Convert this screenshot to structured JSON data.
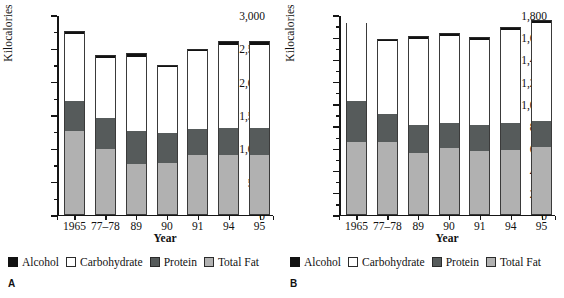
{
  "figure": {
    "legend_labels": {
      "alcohol": "Alcohol",
      "carbohydrate": "Carbohydrate",
      "protein": "Protein",
      "total_fat": "Total Fat"
    },
    "colors": {
      "alcohol": "#121212",
      "carbohydrate": "#ffffff",
      "protein": "#565b5b",
      "total_fat": "#b1b1b1"
    }
  },
  "panels": [
    {
      "letter": "A"
    },
    {
      "letter": "B"
    }
  ],
  "chart_data": [
    {
      "panel": "A",
      "type": "bar",
      "stacked": true,
      "title": "",
      "xlabel": "Year",
      "ylabel": "Kilocalories",
      "categories": [
        "1965",
        "77–78",
        "89",
        "90",
        "91",
        "94",
        "95"
      ],
      "ylim": [
        0,
        3000
      ],
      "yticks": [
        0,
        500,
        1000,
        1500,
        2000,
        2500,
        3000
      ],
      "ytick_labels": [
        "0",
        "500",
        "1,000",
        "1,500",
        "2,000",
        "2,500",
        "3,000"
      ],
      "yminor_step": 250,
      "grid": false,
      "legend_position": "below",
      "series": [
        {
          "name": "Total Fat",
          "values": [
            1250,
            990,
            760,
            780,
            900,
            900,
            900
          ]
        },
        {
          "name": "Protein",
          "values": [
            450,
            460,
            490,
            440,
            390,
            400,
            400
          ]
        },
        {
          "name": "Carbohydrate",
          "values": [
            1010,
            900,
            1120,
            990,
            1170,
            1250,
            1250
          ]
        },
        {
          "name": "Alcohol",
          "values": [
            50,
            50,
            50,
            40,
            30,
            50,
            50
          ]
        }
      ],
      "totals": [
        2760,
        2400,
        2420,
        2250,
        2490,
        2600,
        2600
      ]
    },
    {
      "panel": "B",
      "type": "bar",
      "stacked": true,
      "title": "",
      "xlabel": "Year",
      "ylabel": "Kilocalories",
      "categories": [
        "1965",
        "77–78",
        "89",
        "90",
        "91",
        "94",
        "95"
      ],
      "ylim": [
        0,
        1800
      ],
      "yticks": [
        0,
        200,
        400,
        600,
        800,
        1000,
        1200,
        1400,
        1600,
        1800
      ],
      "ytick_labels": [
        "0",
        "200",
        "400",
        "600",
        "800",
        "1,000",
        "1,200",
        "1,400",
        "1,600",
        "1,800"
      ],
      "yminor_step": 100,
      "grid": false,
      "legend_position": "below",
      "series": [
        {
          "name": "Total Fat",
          "values": [
            650,
            650,
            555,
            600,
            575,
            585,
            605
          ]
        },
        {
          "name": "Protein",
          "values": [
            370,
            255,
            250,
            225,
            235,
            235,
            240
          ]
        },
        {
          "name": "Carbohydrate",
          "values": [
            700,
            655,
            775,
            785,
            765,
            845,
            880
          ]
        },
        {
          "name": "Alcohol",
          "values": [
            0,
            20,
            25,
            25,
            20,
            25,
            25
          ]
        }
      ],
      "totals": [
        1720,
        1580,
        1605,
        1635,
        1595,
        1690,
        1750
      ]
    }
  ]
}
